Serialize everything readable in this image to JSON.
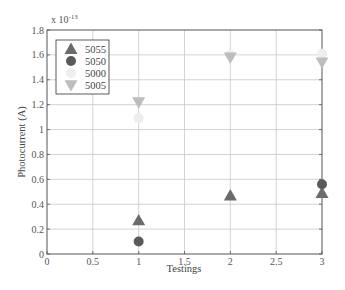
{
  "chart_data": {
    "type": "scatter",
    "title": "",
    "xlabel": "Testings",
    "ylabel": "Photocurrent (A)",
    "y_exponent_label": "x 10",
    "y_exponent_power": "-13",
    "xlim": [
      0,
      3
    ],
    "ylim": [
      0,
      1.8
    ],
    "xticks": [
      "0",
      "0.5",
      "1",
      "1.5",
      "2",
      "2.5",
      "3"
    ],
    "yticks": [
      "0",
      "0.2",
      "0.4",
      "0.6",
      "0.8",
      "1",
      "1.2",
      "1.4",
      "1.6",
      "1.8"
    ],
    "grid": true,
    "legend_position": "upper left",
    "series": [
      {
        "name": "5055",
        "marker": "triangle-up",
        "color": "#6b6b6b",
        "points": [
          {
            "x": 1,
            "y": 0.27
          },
          {
            "x": 2,
            "y": 0.47
          },
          {
            "x": 3,
            "y": 0.49
          }
        ]
      },
      {
        "name": "5050",
        "marker": "circle",
        "color": "#5a5a5a",
        "points": [
          {
            "x": 1,
            "y": 0.1
          },
          {
            "x": 3,
            "y": 0.56
          }
        ]
      },
      {
        "name": "5000",
        "marker": "circle",
        "color": "#eeeeee",
        "points": [
          {
            "x": 1,
            "y": 1.09
          },
          {
            "x": 2,
            "y": 1.6
          },
          {
            "x": 3,
            "y": 1.61
          }
        ]
      },
      {
        "name": "5005",
        "marker": "triangle-down",
        "color": "#bdbdbd",
        "points": [
          {
            "x": 1,
            "y": 1.22
          },
          {
            "x": 2,
            "y": 1.58
          },
          {
            "x": 3,
            "y": 1.54
          }
        ]
      }
    ]
  }
}
